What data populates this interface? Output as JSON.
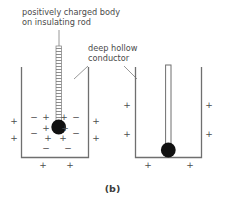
{
  "figure": {
    "caption": "(b)",
    "background_color": "#ffffff",
    "ink_color": "#4d4d4d",
    "ball_color": "#111111",
    "labels": {
      "rod_label_line1": "positively charged body",
      "rod_label_line2": "on insulating rod",
      "conductor_label_line1": "deep hollow",
      "conductor_label_line2": "conductor"
    },
    "left_panel": {
      "name": "left-container",
      "description": "charged body on insulating rod lowered inside deep hollow conductor",
      "inner_charges": [
        {
          "sign": "−",
          "x": 34,
          "y": 120
        },
        {
          "sign": "−",
          "x": 34,
          "y": 136
        },
        {
          "sign": "−",
          "x": 76,
          "y": 120
        },
        {
          "sign": "−",
          "x": 76,
          "y": 136
        },
        {
          "sign": "−",
          "x": 46,
          "y": 151
        },
        {
          "sign": "−",
          "x": 68,
          "y": 151
        },
        {
          "sign": "+",
          "x": 46,
          "y": 120
        },
        {
          "sign": "+",
          "x": 46,
          "y": 131
        },
        {
          "sign": "+",
          "x": 48,
          "y": 141
        },
        {
          "sign": "+",
          "x": 64,
          "y": 120
        },
        {
          "sign": "+",
          "x": 65,
          "y": 131
        },
        {
          "sign": "+",
          "x": 63,
          "y": 141
        }
      ],
      "outer_charges": [
        {
          "sign": "+",
          "x": 14,
          "y": 124
        },
        {
          "sign": "+",
          "x": 14,
          "y": 141
        },
        {
          "sign": "+",
          "x": 96,
          "y": 124
        },
        {
          "sign": "+",
          "x": 96,
          "y": 141
        },
        {
          "sign": "+",
          "x": 43,
          "y": 168
        },
        {
          "sign": "+",
          "x": 70,
          "y": 168
        }
      ]
    },
    "right_panel": {
      "name": "right-container",
      "description": "charged body touched to inner surface of deep hollow conductor",
      "inner_charges": [],
      "outer_charges": [
        {
          "sign": "+",
          "x": 127,
          "y": 108
        },
        {
          "sign": "+",
          "x": 127,
          "y": 137
        },
        {
          "sign": "+",
          "x": 209,
          "y": 108
        },
        {
          "sign": "+",
          "x": 209,
          "y": 137
        },
        {
          "sign": "+",
          "x": 148,
          "y": 168
        },
        {
          "sign": "+",
          "x": 190,
          "y": 168
        }
      ]
    }
  }
}
